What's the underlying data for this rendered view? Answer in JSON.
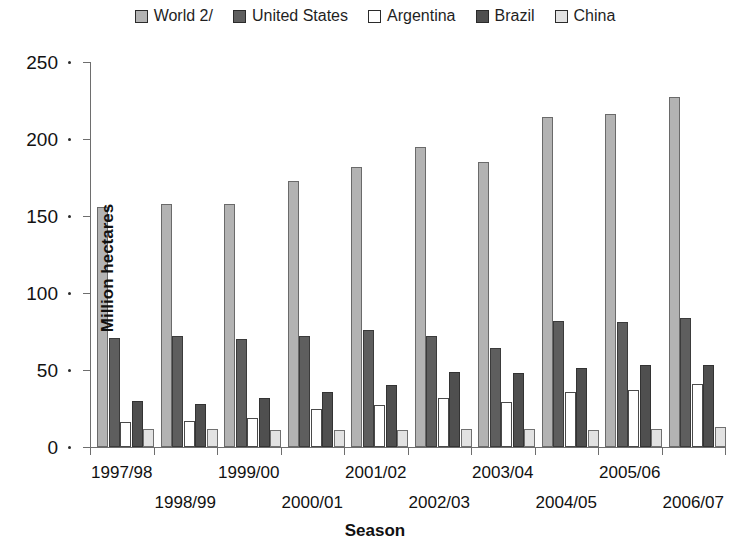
{
  "chart_data": {
    "type": "bar",
    "title": "",
    "xlabel": "Season",
    "ylabel": "Million hectares",
    "ylim": [
      0,
      250
    ],
    "yticks": [
      0,
      50,
      100,
      150,
      200,
      250
    ],
    "grid": false,
    "legend_position": "top-center",
    "categories": [
      "1997/98",
      "1998/99",
      "1999/00",
      "2000/01",
      "2001/02",
      "2002/03",
      "2003/04",
      "2004/05",
      "2005/06",
      "2006/07"
    ],
    "series": [
      {
        "name": "World 2/",
        "color": "#b3b3b3",
        "values": [
          156,
          158,
          158,
          173,
          182,
          195,
          185,
          214,
          216,
          227
        ]
      },
      {
        "name": "United States",
        "color": "#5e5e5e",
        "values": [
          71,
          72,
          70,
          72,
          76,
          72,
          64,
          82,
          81,
          84
        ]
      },
      {
        "name": "Argentina",
        "color": "#ffffff",
        "values": [
          16,
          17,
          19,
          25,
          27,
          32,
          29,
          36,
          37,
          41
        ]
      },
      {
        "name": "Brazil",
        "color": "#4f4f4f",
        "values": [
          30,
          28,
          32,
          36,
          40,
          49,
          48,
          51,
          53,
          53
        ]
      },
      {
        "name": "China",
        "color": "#e2e2e2",
        "values": [
          12,
          12,
          11,
          11,
          11,
          12,
          12,
          11,
          12,
          13
        ]
      }
    ]
  }
}
